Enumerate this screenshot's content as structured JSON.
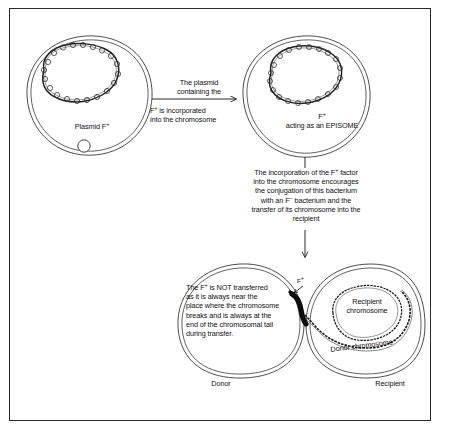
{
  "figure": {
    "border_color": "#2b2b2b",
    "ink_color": "#111111",
    "background": "#ffffff"
  },
  "step1_cell": {
    "chromosome_note": "circular beaded chromosome",
    "label": "Plasmid F",
    "label_sup": "+",
    "plasmid_note": "small free circular plasmid"
  },
  "arrow_caption": {
    "line1": "The plasmid",
    "line2": "containing the",
    "line3_pre": "F",
    "line3_sup": "+",
    "line3_post": " is incorporated",
    "line4": "into the chromosome"
  },
  "step2_cell": {
    "label_pre": "F",
    "label_sup": "+",
    "label_line2": "acting as an EPISOME"
  },
  "incorporation_text": {
    "line1_pre": "The incorporation of the F",
    "line1_sup": "+",
    "line1_post": " factor",
    "line2": "into the chromosome encourages",
    "line3": "the conjugation of this bacterium",
    "line4_pre": "with an F",
    "line4_sup": "−",
    "line4_post": " bacterium and the",
    "line5": "transfer of its chromosome into the",
    "line6": "recipient"
  },
  "donor_note": {
    "line1_pre": "The F",
    "line1_sup": "+",
    "line1_post": " is NOT transferred",
    "line2": "as it is always near the",
    "line3": "place where the chromosome",
    "line4": "breaks and is always at the",
    "line5": "end of the chromosomal tail",
    "line6": "during transfer."
  },
  "bridge": {
    "fplus_pre": "F",
    "fplus_sup": "+"
  },
  "recipient_cell": {
    "chromosome_label_line1": "Recipient",
    "chromosome_label_line2": "chromosome",
    "donor_chromosome_label": "Donor chromosome"
  },
  "cell_labels": {
    "donor": "Donor",
    "recipient": "Recipient"
  }
}
